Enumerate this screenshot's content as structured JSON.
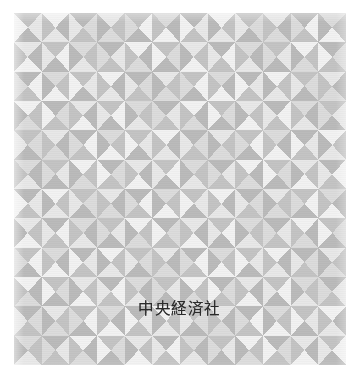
{
  "cover": {
    "type": "book-cover-scan",
    "publisher_imprint": "中央経済社",
    "background_color": "#ffffff",
    "artwork": {
      "left": 14,
      "top": 13,
      "width": 332,
      "height": 352,
      "description": "repeating pinwheel grid of four right triangles per cell in graduated grey tones"
    }
  },
  "pattern": {
    "cell_size": 30,
    "columns": 12,
    "rows": 12,
    "palette": [
      "#fbfbfb",
      "#f2f2f2",
      "#e8e8e8",
      "#dcdcdc",
      "#d0d0d0",
      "#c4c4c4",
      "#bbbbbb",
      "#b2b2b2"
    ],
    "tiles": [
      [
        [
          5,
          2,
          6,
          1
        ],
        [
          1,
          6,
          2,
          5
        ],
        [
          6,
          3,
          5,
          2
        ],
        [
          2,
          5,
          3,
          6
        ],
        [
          5,
          1,
          6,
          3
        ],
        [
          3,
          6,
          1,
          5
        ],
        [
          6,
          2,
          5,
          1
        ],
        [
          1,
          5,
          2,
          6
        ],
        [
          5,
          3,
          6,
          2
        ],
        [
          2,
          6,
          3,
          5
        ],
        [
          6,
          1,
          5,
          3
        ],
        [
          3,
          5,
          1,
          6
        ]
      ],
      [
        [
          2,
          6,
          1,
          5
        ],
        [
          5,
          1,
          6,
          2
        ],
        [
          3,
          5,
          2,
          6
        ],
        [
          6,
          2,
          5,
          3
        ],
        [
          1,
          6,
          3,
          5
        ],
        [
          5,
          3,
          6,
          1
        ],
        [
          2,
          5,
          1,
          6
        ],
        [
          6,
          1,
          5,
          2
        ],
        [
          3,
          6,
          2,
          5
        ],
        [
          5,
          2,
          6,
          3
        ],
        [
          1,
          5,
          3,
          6
        ],
        [
          6,
          3,
          5,
          1
        ]
      ],
      [
        [
          6,
          1,
          5,
          3
        ],
        [
          3,
          5,
          1,
          6
        ],
        [
          5,
          2,
          6,
          1
        ],
        [
          1,
          6,
          2,
          5
        ],
        [
          6,
          3,
          5,
          2
        ],
        [
          2,
          5,
          3,
          6
        ],
        [
          5,
          1,
          6,
          3
        ],
        [
          3,
          6,
          1,
          5
        ],
        [
          6,
          2,
          5,
          1
        ],
        [
          1,
          5,
          2,
          6
        ],
        [
          5,
          3,
          6,
          2
        ],
        [
          2,
          6,
          3,
          5
        ]
      ],
      [
        [
          1,
          5,
          3,
          6
        ],
        [
          6,
          3,
          5,
          1
        ],
        [
          2,
          6,
          1,
          5
        ],
        [
          5,
          1,
          6,
          2
        ],
        [
          3,
          5,
          2,
          6
        ],
        [
          6,
          2,
          5,
          3
        ],
        [
          1,
          6,
          3,
          5
        ],
        [
          5,
          3,
          6,
          1
        ],
        [
          2,
          5,
          1,
          6
        ],
        [
          6,
          1,
          5,
          2
        ],
        [
          3,
          6,
          2,
          5
        ],
        [
          5,
          2,
          6,
          3
        ]
      ],
      [
        [
          5,
          3,
          6,
          2
        ],
        [
          2,
          6,
          3,
          5
        ],
        [
          6,
          1,
          5,
          3
        ],
        [
          3,
          5,
          1,
          6
        ],
        [
          5,
          2,
          6,
          1
        ],
        [
          1,
          6,
          2,
          5
        ],
        [
          6,
          3,
          5,
          2
        ],
        [
          2,
          5,
          3,
          6
        ],
        [
          5,
          1,
          6,
          3
        ],
        [
          3,
          6,
          1,
          5
        ],
        [
          6,
          2,
          5,
          1
        ],
        [
          1,
          5,
          2,
          6
        ]
      ],
      [
        [
          3,
          6,
          2,
          5
        ],
        [
          5,
          2,
          6,
          3
        ],
        [
          1,
          5,
          3,
          6
        ],
        [
          6,
          3,
          5,
          1
        ],
        [
          2,
          6,
          1,
          5
        ],
        [
          5,
          1,
          6,
          2
        ],
        [
          3,
          5,
          2,
          6
        ],
        [
          6,
          2,
          5,
          3
        ],
        [
          1,
          6,
          3,
          5
        ],
        [
          5,
          3,
          6,
          1
        ],
        [
          2,
          5,
          1,
          6
        ],
        [
          6,
          1,
          5,
          2
        ]
      ],
      [
        [
          6,
          2,
          5,
          1
        ],
        [
          1,
          5,
          2,
          6
        ],
        [
          5,
          3,
          6,
          2
        ],
        [
          2,
          6,
          3,
          5
        ],
        [
          6,
          1,
          5,
          3
        ],
        [
          3,
          5,
          1,
          6
        ],
        [
          5,
          2,
          6,
          1
        ],
        [
          1,
          6,
          2,
          5
        ],
        [
          6,
          3,
          5,
          2
        ],
        [
          2,
          5,
          3,
          6
        ],
        [
          5,
          1,
          6,
          3
        ],
        [
          3,
          6,
          1,
          5
        ]
      ],
      [
        [
          2,
          5,
          1,
          6
        ],
        [
          6,
          1,
          5,
          2
        ],
        [
          3,
          6,
          2,
          5
        ],
        [
          5,
          2,
          6,
          3
        ],
        [
          1,
          5,
          3,
          6
        ],
        [
          6,
          3,
          5,
          1
        ],
        [
          2,
          6,
          1,
          5
        ],
        [
          5,
          1,
          6,
          2
        ],
        [
          3,
          5,
          2,
          6
        ],
        [
          6,
          2,
          5,
          3
        ],
        [
          1,
          6,
          3,
          5
        ],
        [
          5,
          3,
          6,
          1
        ]
      ],
      [
        [
          5,
          1,
          6,
          3
        ],
        [
          3,
          6,
          1,
          5
        ],
        [
          6,
          2,
          5,
          1
        ],
        [
          1,
          5,
          2,
          6
        ],
        [
          5,
          3,
          6,
          2
        ],
        [
          2,
          6,
          3,
          5
        ],
        [
          6,
          1,
          5,
          3
        ],
        [
          3,
          5,
          1,
          6
        ],
        [
          5,
          2,
          6,
          1
        ],
        [
          1,
          6,
          2,
          5
        ],
        [
          6,
          3,
          5,
          2
        ],
        [
          2,
          5,
          3,
          6
        ]
      ],
      [
        [
          1,
          6,
          3,
          5
        ],
        [
          5,
          3,
          6,
          1
        ],
        [
          2,
          5,
          1,
          6
        ],
        [
          6,
          1,
          5,
          2
        ],
        [
          3,
          6,
          2,
          5
        ],
        [
          5,
          2,
          6,
          3
        ],
        [
          1,
          5,
          3,
          6
        ],
        [
          6,
          3,
          5,
          1
        ],
        [
          2,
          6,
          1,
          5
        ],
        [
          5,
          1,
          6,
          2
        ],
        [
          3,
          5,
          2,
          6
        ],
        [
          6,
          2,
          5,
          3
        ]
      ],
      [
        [
          6,
          3,
          5,
          2
        ],
        [
          2,
          5,
          3,
          6
        ],
        [
          5,
          1,
          6,
          3
        ],
        [
          3,
          6,
          1,
          5
        ],
        [
          6,
          2,
          5,
          1
        ],
        [
          1,
          5,
          2,
          6
        ],
        [
          5,
          3,
          6,
          2
        ],
        [
          2,
          6,
          3,
          5
        ],
        [
          6,
          1,
          5,
          3
        ],
        [
          3,
          5,
          1,
          6
        ],
        [
          5,
          2,
          6,
          1
        ],
        [
          1,
          6,
          2,
          5
        ]
      ],
      [
        [
          3,
          5,
          2,
          6
        ],
        [
          6,
          2,
          5,
          3
        ],
        [
          1,
          6,
          3,
          5
        ],
        [
          5,
          3,
          6,
          1
        ],
        [
          2,
          5,
          1,
          6
        ],
        [
          6,
          1,
          5,
          2
        ],
        [
          3,
          6,
          2,
          5
        ],
        [
          5,
          2,
          6,
          3
        ],
        [
          1,
          5,
          3,
          6
        ],
        [
          6,
          3,
          5,
          1
        ],
        [
          2,
          6,
          1,
          5
        ],
        [
          5,
          1,
          6,
          2
        ]
      ]
    ]
  }
}
